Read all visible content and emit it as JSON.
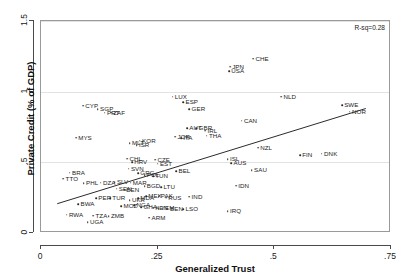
{
  "chart_data": {
    "type": "scatter",
    "title": "",
    "xlabel": "Generalized Trust",
    "ylabel": "Private Credit (% of GDP)",
    "xlim": [
      0,
      0.75
    ],
    "ylim": [
      0,
      1.5
    ],
    "xticks": [
      0,
      0.25,
      0.5,
      0.75
    ],
    "xticklabels": [
      "0",
      ".25",
      ".5",
      ".75"
    ],
    "yticks": [
      0,
      0.5,
      1,
      1.5
    ],
    "yticklabels": [
      "0",
      ".5",
      "1",
      "1.5"
    ],
    "grid": "horizontal",
    "legend": "none",
    "annotation": "R-sq=0.28",
    "fit_line": {
      "type": "linear",
      "x": [
        0.035,
        0.7
      ],
      "y": [
        0.195,
        0.875
      ],
      "slope": 1.023,
      "intercept": 0.159
    },
    "point_label_key": "iso3_country_code",
    "points": [
      {
        "label": "CHE",
        "x": 0.455,
        "y": 1.235
      },
      {
        "label": "JPN",
        "x": 0.405,
        "y": 1.175
      },
      {
        "label": "USA",
        "x": 0.403,
        "y": 1.145
      },
      {
        "label": "NLD",
        "x": 0.515,
        "y": 0.965
      },
      {
        "label": "LUX",
        "x": 0.282,
        "y": 0.965
      },
      {
        "label": "SWE",
        "x": 0.645,
        "y": 0.905
      },
      {
        "label": "ESP",
        "x": 0.305,
        "y": 0.925
      },
      {
        "label": "CYP",
        "x": 0.09,
        "y": 0.9
      },
      {
        "label": "SGP",
        "x": 0.122,
        "y": 0.875
      },
      {
        "label": "GER",
        "x": 0.318,
        "y": 0.875
      },
      {
        "label": "NOR",
        "x": 0.662,
        "y": 0.86
      },
      {
        "label": "PRT",
        "x": 0.137,
        "y": 0.852
      },
      {
        "label": "ZAF",
        "x": 0.15,
        "y": 0.85
      },
      {
        "label": "CAN",
        "x": 0.43,
        "y": 0.795
      },
      {
        "label": "AUT",
        "x": 0.313,
        "y": 0.74
      },
      {
        "label": "GBR",
        "x": 0.333,
        "y": 0.74
      },
      {
        "label": "IRL",
        "x": 0.352,
        "y": 0.725
      },
      {
        "label": "MYS",
        "x": 0.075,
        "y": 0.675
      },
      {
        "label": "THA",
        "x": 0.355,
        "y": 0.69
      },
      {
        "label": "JOR",
        "x": 0.288,
        "y": 0.68
      },
      {
        "label": "ITA",
        "x": 0.3,
        "y": 0.672
      },
      {
        "label": "KOR",
        "x": 0.212,
        "y": 0.652
      },
      {
        "label": "MLT",
        "x": 0.19,
        "y": 0.635
      },
      {
        "label": "ISR",
        "x": 0.205,
        "y": 0.62
      },
      {
        "label": "NZL",
        "x": 0.465,
        "y": 0.605
      },
      {
        "label": "DNK",
        "x": 0.602,
        "y": 0.56
      },
      {
        "label": "FIN",
        "x": 0.555,
        "y": 0.55
      },
      {
        "label": "CHL",
        "x": 0.185,
        "y": 0.525
      },
      {
        "label": "ISL",
        "x": 0.4,
        "y": 0.522
      },
      {
        "label": "CZE",
        "x": 0.245,
        "y": 0.52
      },
      {
        "label": "HRV",
        "x": 0.195,
        "y": 0.5
      },
      {
        "label": "AUS",
        "x": 0.408,
        "y": 0.495
      },
      {
        "label": "EST",
        "x": 0.25,
        "y": 0.492
      },
      {
        "label": "SVN",
        "x": 0.188,
        "y": 0.455
      },
      {
        "label": "SAU",
        "x": 0.452,
        "y": 0.445
      },
      {
        "label": "BEL",
        "x": 0.29,
        "y": 0.438
      },
      {
        "label": "BRA",
        "x": 0.062,
        "y": 0.428
      },
      {
        "label": "GRC",
        "x": 0.208,
        "y": 0.422
      },
      {
        "label": "POL",
        "x": 0.222,
        "y": 0.408
      },
      {
        "label": "TUN",
        "x": 0.24,
        "y": 0.402
      },
      {
        "label": "TTO",
        "x": 0.048,
        "y": 0.385
      },
      {
        "label": "SLV",
        "x": 0.158,
        "y": 0.358
      },
      {
        "label": "MAR",
        "x": 0.192,
        "y": 0.355
      },
      {
        "label": "PHL",
        "x": 0.092,
        "y": 0.352
      },
      {
        "label": "DZA",
        "x": 0.128,
        "y": 0.355
      },
      {
        "label": "IDN",
        "x": 0.418,
        "y": 0.335
      },
      {
        "label": "BGD",
        "x": 0.222,
        "y": 0.33
      },
      {
        "label": "LTU",
        "x": 0.258,
        "y": 0.325
      },
      {
        "label": "SEN",
        "x": 0.162,
        "y": 0.312
      },
      {
        "label": "BEN",
        "x": 0.178,
        "y": 0.308
      },
      {
        "label": "IND",
        "x": 0.318,
        "y": 0.258
      },
      {
        "label": "MEX",
        "x": 0.225,
        "y": 0.262
      },
      {
        "label": "PAK",
        "x": 0.252,
        "y": 0.262
      },
      {
        "label": "RUS",
        "x": 0.268,
        "y": 0.248
      },
      {
        "label": "MDA",
        "x": 0.208,
        "y": 0.245
      },
      {
        "label": "PER",
        "x": 0.118,
        "y": 0.245
      },
      {
        "label": "TUR",
        "x": 0.148,
        "y": 0.245
      },
      {
        "label": "UKR",
        "x": 0.19,
        "y": 0.232
      },
      {
        "label": "BWA",
        "x": 0.08,
        "y": 0.205
      },
      {
        "label": "NGA",
        "x": 0.2,
        "y": 0.195
      },
      {
        "label": "MOZ",
        "x": 0.172,
        "y": 0.19
      },
      {
        "label": "GHA",
        "x": 0.215,
        "y": 0.182
      },
      {
        "label": "KEN",
        "x": 0.24,
        "y": 0.178
      },
      {
        "label": "YEM",
        "x": 0.252,
        "y": 0.175
      },
      {
        "label": "BEN2",
        "x": 0.272,
        "y": 0.172
      },
      {
        "label": "LSO",
        "x": 0.305,
        "y": 0.168
      },
      {
        "label": "IRQ",
        "x": 0.4,
        "y": 0.155
      },
      {
        "label": "RWA",
        "x": 0.055,
        "y": 0.13
      },
      {
        "label": "TZA",
        "x": 0.112,
        "y": 0.122
      },
      {
        "label": "ZMB",
        "x": 0.145,
        "y": 0.118
      },
      {
        "label": "ARM",
        "x": 0.232,
        "y": 0.11
      },
      {
        "label": "UGA",
        "x": 0.1,
        "y": 0.075
      }
    ],
    "point_count": 73
  }
}
